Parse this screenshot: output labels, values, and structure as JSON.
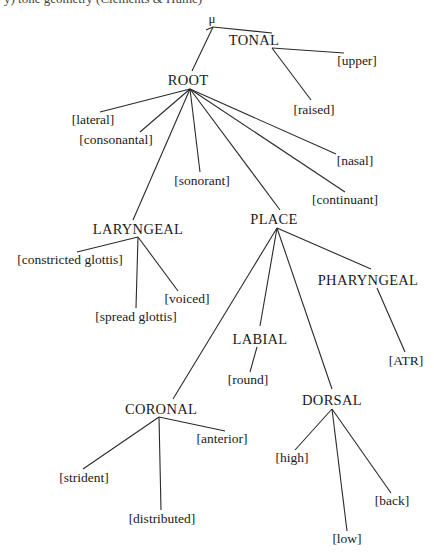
{
  "caption_clipped": "y) tone geometry (Clements & Hume)",
  "tree": {
    "mora": {
      "label": "μ",
      "x": 212,
      "y": 18
    },
    "tonal": {
      "label": "TONAL",
      "x": 254,
      "y": 40
    },
    "upper": {
      "label": "[upper]",
      "x": 357,
      "y": 61
    },
    "raised": {
      "label": "[raised]",
      "x": 314,
      "y": 110
    },
    "root": {
      "label": "ROOT",
      "x": 188,
      "y": 80
    },
    "lateral": {
      "label": "[lateral]",
      "x": 93,
      "y": 120
    },
    "consonantal": {
      "label": "[consonantal]",
      "x": 116,
      "y": 140
    },
    "sonorant": {
      "label": "[sonorant]",
      "x": 202,
      "y": 181
    },
    "nasal": {
      "label": "[nasal]",
      "x": 355,
      "y": 161
    },
    "continuant": {
      "label": "[continuant]",
      "x": 345,
      "y": 200
    },
    "laryngeal": {
      "label": "LARYNGEAL",
      "x": 138,
      "y": 229
    },
    "place": {
      "label": "PLACE",
      "x": 274,
      "y": 219
    },
    "constricted_glottis": {
      "label": "[constricted glottis]",
      "x": 70,
      "y": 260
    },
    "voiced": {
      "label": "[voiced]",
      "x": 187,
      "y": 299
    },
    "spread_glottis": {
      "label": "[spread glottis]",
      "x": 136,
      "y": 317
    },
    "pharyngeal": {
      "label": "PHARYNGEAL",
      "x": 368,
      "y": 280
    },
    "atr": {
      "label": "[ATR]",
      "x": 406,
      "y": 361
    },
    "labial": {
      "label": "LABIAL",
      "x": 260,
      "y": 339
    },
    "round": {
      "label": "[round]",
      "x": 248,
      "y": 380
    },
    "coronal": {
      "label": "CORONAL",
      "x": 161,
      "y": 409
    },
    "dorsal": {
      "label": "DORSAL",
      "x": 332,
      "y": 400
    },
    "anterior": {
      "label": "[anterior]",
      "x": 222,
      "y": 439
    },
    "strident": {
      "label": "[strident]",
      "x": 84,
      "y": 478
    },
    "distributed": {
      "label": "[distributed]",
      "x": 162,
      "y": 519
    },
    "high": {
      "label": "[high]",
      "x": 292,
      "y": 458
    },
    "back": {
      "label": "[back]",
      "x": 392,
      "y": 501
    },
    "low": {
      "label": "[low]",
      "x": 347,
      "y": 539
    }
  },
  "edges": [
    [
      "mora",
      "tonal"
    ],
    [
      "mora",
      "root"
    ],
    [
      "tonal",
      "upper"
    ],
    [
      "tonal",
      "raised"
    ],
    [
      "root",
      "lateral"
    ],
    [
      "root",
      "consonantal"
    ],
    [
      "root",
      "sonorant"
    ],
    [
      "root",
      "nasal"
    ],
    [
      "root",
      "continuant"
    ],
    [
      "root",
      "laryngeal"
    ],
    [
      "root",
      "place"
    ],
    [
      "laryngeal",
      "constricted_glottis"
    ],
    [
      "laryngeal",
      "spread_glottis"
    ],
    [
      "laryngeal",
      "voiced"
    ],
    [
      "place",
      "coronal"
    ],
    [
      "place",
      "labial"
    ],
    [
      "place",
      "dorsal"
    ],
    [
      "place",
      "pharyngeal"
    ],
    [
      "labial",
      "round"
    ],
    [
      "pharyngeal",
      "atr"
    ],
    [
      "coronal",
      "strident"
    ],
    [
      "coronal",
      "distributed"
    ],
    [
      "coronal",
      "anterior"
    ],
    [
      "dorsal",
      "high"
    ],
    [
      "dorsal",
      "low"
    ],
    [
      "dorsal",
      "back"
    ]
  ]
}
